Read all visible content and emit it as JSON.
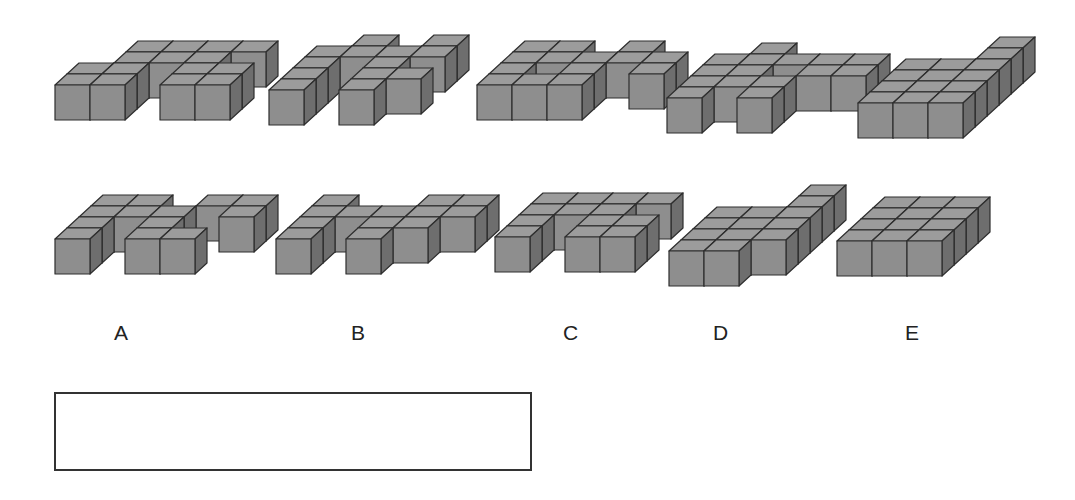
{
  "puzzle": {
    "top_row_figures": [
      {
        "id": "q1",
        "x": 54,
        "y": 40,
        "cubes": [
          [
            0,
            0
          ],
          [
            1,
            0
          ],
          [
            0,
            1
          ],
          [
            1,
            1
          ],
          [
            1,
            2
          ],
          [
            2,
            2
          ],
          [
            3,
            2
          ],
          [
            1,
            3
          ],
          [
            3,
            3
          ],
          [
            4,
            3
          ],
          [
            3,
            1
          ],
          [
            4,
            1
          ],
          [
            3,
            0
          ],
          [
            4,
            0
          ],
          [
            2,
            3
          ]
        ]
      },
      {
        "id": "q2",
        "x": 268,
        "y": 34,
        "cubes": [
          [
            0,
            0
          ],
          [
            0,
            1
          ],
          [
            0,
            2
          ],
          [
            0,
            3
          ],
          [
            1,
            3
          ],
          [
            1,
            4
          ],
          [
            2,
            3
          ],
          [
            3,
            3
          ],
          [
            3,
            4
          ],
          [
            2,
            2
          ],
          [
            2,
            1
          ],
          [
            3,
            1
          ],
          [
            2,
            0
          ]
        ]
      },
      {
        "id": "q3",
        "x": 476,
        "y": 40,
        "cubes": [
          [
            0,
            0
          ],
          [
            1,
            0
          ],
          [
            2,
            0
          ],
          [
            0,
            1
          ],
          [
            2,
            1
          ],
          [
            0,
            2
          ],
          [
            1,
            2
          ],
          [
            2,
            2
          ],
          [
            3,
            2
          ],
          [
            1,
            3
          ],
          [
            3,
            3
          ],
          [
            0,
            3
          ],
          [
            4,
            2
          ],
          [
            4,
            1
          ]
        ]
      },
      {
        "id": "q4",
        "x": 666,
        "y": 42,
        "cubes": [
          [
            0,
            0
          ],
          [
            0,
            1
          ],
          [
            0,
            2
          ],
          [
            0,
            3
          ],
          [
            1,
            3
          ],
          [
            2,
            3
          ],
          [
            1,
            2
          ],
          [
            1,
            1
          ],
          [
            2,
            1
          ],
          [
            2,
            0
          ],
          [
            3,
            2
          ],
          [
            3,
            3
          ],
          [
            4,
            3
          ],
          [
            4,
            2
          ],
          [
            1,
            4
          ]
        ]
      },
      {
        "id": "q5",
        "x": 857,
        "y": 36,
        "cubes": [
          [
            0,
            0
          ],
          [
            1,
            0
          ],
          [
            2,
            0
          ],
          [
            0,
            1
          ],
          [
            1,
            1
          ],
          [
            2,
            1
          ],
          [
            0,
            2
          ],
          [
            1,
            2
          ],
          [
            2,
            2
          ],
          [
            0,
            3
          ],
          [
            2,
            3
          ],
          [
            2,
            4
          ],
          [
            2,
            5
          ],
          [
            1,
            3
          ]
        ]
      }
    ],
    "bottom_row_figures": [
      {
        "id": "A",
        "x": 54,
        "y": 194,
        "cubes": [
          [
            0,
            0
          ],
          [
            0,
            1
          ],
          [
            0,
            2
          ],
          [
            0,
            3
          ],
          [
            1,
            3
          ],
          [
            1,
            2
          ],
          [
            2,
            2
          ],
          [
            2,
            1
          ],
          [
            2,
            0
          ],
          [
            3,
            0
          ],
          [
            3,
            3
          ],
          [
            4,
            3
          ],
          [
            4,
            2
          ]
        ]
      },
      {
        "id": "B",
        "x": 275,
        "y": 194,
        "cubes": [
          [
            0,
            0
          ],
          [
            0,
            1
          ],
          [
            0,
            2
          ],
          [
            0,
            3
          ],
          [
            1,
            2
          ],
          [
            2,
            2
          ],
          [
            2,
            1
          ],
          [
            2,
            0
          ],
          [
            3,
            2
          ],
          [
            3,
            3
          ],
          [
            4,
            3
          ],
          [
            4,
            2
          ],
          [
            3,
            1
          ]
        ]
      },
      {
        "id": "C",
        "x": 494,
        "y": 192,
        "cubes": [
          [
            0,
            0
          ],
          [
            0,
            1
          ],
          [
            0,
            2
          ],
          [
            0,
            3
          ],
          [
            1,
            3
          ],
          [
            2,
            3
          ],
          [
            1,
            2
          ],
          [
            2,
            2
          ],
          [
            2,
            1
          ],
          [
            2,
            0
          ],
          [
            3,
            0
          ],
          [
            3,
            1
          ],
          [
            3,
            3
          ]
        ]
      },
      {
        "id": "D",
        "x": 668,
        "y": 184,
        "cubes": [
          [
            0,
            0
          ],
          [
            0,
            1
          ],
          [
            0,
            2
          ],
          [
            0,
            3
          ],
          [
            1,
            3
          ],
          [
            1,
            2
          ],
          [
            1,
            1
          ],
          [
            1,
            0
          ],
          [
            2,
            1
          ],
          [
            2,
            2
          ],
          [
            2,
            3
          ],
          [
            2,
            4
          ],
          [
            2,
            5
          ]
        ]
      },
      {
        "id": "E",
        "x": 836,
        "y": 196,
        "cubes": [
          [
            0,
            0
          ],
          [
            0,
            1
          ],
          [
            0,
            2
          ],
          [
            0,
            3
          ],
          [
            1,
            3
          ],
          [
            2,
            3
          ],
          [
            1,
            2
          ],
          [
            1,
            1
          ],
          [
            1,
            0
          ],
          [
            2,
            2
          ],
          [
            2,
            1
          ],
          [
            2,
            0
          ]
        ]
      }
    ],
    "answer_labels": [
      {
        "text": "A",
        "x": 114,
        "y": 322
      },
      {
        "text": "B",
        "x": 351,
        "y": 322
      },
      {
        "text": "C",
        "x": 563,
        "y": 322
      },
      {
        "text": "D",
        "x": 713,
        "y": 322
      },
      {
        "text": "E",
        "x": 905,
        "y": 322
      }
    ],
    "answer_box": {
      "value": ""
    }
  },
  "colors": {
    "top": "#9c9c9c",
    "front": "#8e8e8e",
    "side": "#6e6e6e",
    "edge": "#2e2e2e"
  }
}
